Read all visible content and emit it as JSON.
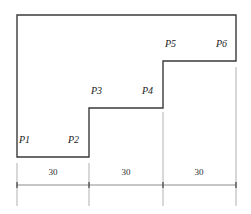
{
  "figure": {
    "outline_color": "#3a3a3a",
    "dimension_color": "#8c8c8c",
    "extension_color": "#b0b0b0",
    "background": "#ffffff",
    "outline_path": "M 17 15 L 236 15 L 236 61 L 163 61 L 163 108 L 89 108 L 89 157 L 17 157 Z",
    "vertices": [
      {
        "id": "P1",
        "label": "P1",
        "x": 17,
        "y": 157,
        "label_x": 19,
        "label_y": 142
      },
      {
        "id": "P2",
        "label": "P2",
        "x": 89,
        "y": 157,
        "label_x": 68,
        "label_y": 142
      },
      {
        "id": "P3",
        "label": "P3",
        "x": 89,
        "y": 108,
        "label_x": 91,
        "label_y": 93
      },
      {
        "id": "P4",
        "label": "P4",
        "x": 163,
        "y": 108,
        "label_x": 142,
        "label_y": 93
      },
      {
        "id": "P5",
        "label": "P5",
        "x": 163,
        "y": 61,
        "label_x": 165,
        "label_y": 46
      },
      {
        "id": "P6",
        "label": "P6",
        "x": 236,
        "y": 61,
        "label_x": 216,
        "label_y": 46
      }
    ],
    "dimension_line": {
      "y": 185,
      "x_start": 17,
      "x_end": 236,
      "tick_positions": [
        17,
        89,
        163,
        236
      ],
      "tick_half_height": 3,
      "segments": [
        {
          "label": "30",
          "x_start": 17,
          "x_end": 89,
          "label_x": 53,
          "label_y": 172
        },
        {
          "label": "30",
          "x_start": 89,
          "x_end": 163,
          "label_x": 126,
          "label_y": 172
        },
        {
          "label": "30",
          "x_start": 163,
          "x_end": 236,
          "label_x": 199,
          "label_y": 172
        }
      ]
    },
    "extension_lines": [
      {
        "x": 17,
        "y_top": 163,
        "y_bottom": 206
      },
      {
        "x": 89,
        "y_top": 163,
        "y_bottom": 206
      },
      {
        "x": 163,
        "y_top": 112,
        "y_bottom": 206
      },
      {
        "x": 236,
        "y_top": 67,
        "y_bottom": 206
      }
    ]
  }
}
